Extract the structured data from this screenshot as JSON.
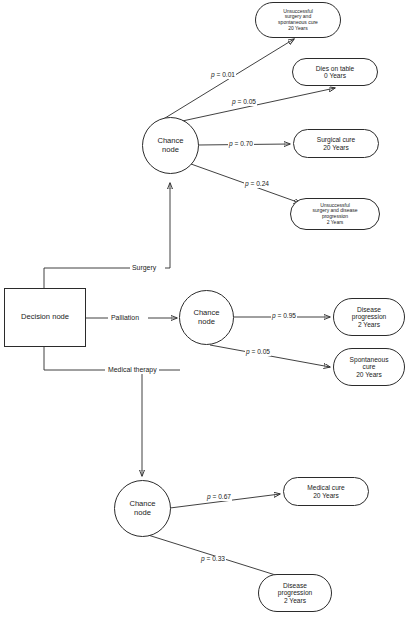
{
  "diagram": {
    "stroke_color": "#2b2b2b",
    "background_color": "#ffffff",
    "decision_node": {
      "label": "Decision node"
    },
    "branches": [
      {
        "id": "surgery",
        "label": "Surgery"
      },
      {
        "id": "palliation",
        "label": "Palliation"
      },
      {
        "id": "medical-therapy",
        "label": "Medical therapy"
      }
    ],
    "chance_nodes": [
      {
        "id": "surgery-chance",
        "line1": "Chance",
        "line2": "node"
      },
      {
        "id": "palliation-chance",
        "line1": "Chance",
        "line2": "node"
      },
      {
        "id": "medical-chance",
        "line1": "Chance",
        "line2": "node"
      }
    ],
    "probabilities": [
      {
        "id": "p-unsuccessful-spontaneous",
        "p": "p",
        "eq": " = 0.01"
      },
      {
        "id": "p-dies-on-table",
        "p": "p",
        "eq": " = 0.05"
      },
      {
        "id": "p-surgical-cure",
        "p": "p",
        "eq": " = 0.70"
      },
      {
        "id": "p-unsuccessful-progression",
        "p": "p",
        "eq": " = 0.24"
      },
      {
        "id": "p-palliation-progression",
        "p": "p",
        "eq": " = 0.95"
      },
      {
        "id": "p-palliation-spontaneous",
        "p": "p",
        "eq": " = 0.05"
      },
      {
        "id": "p-medical-cure",
        "p": "p",
        "eq": " = 0.67"
      },
      {
        "id": "p-medical-progression",
        "p": "p",
        "eq": " = 0.33"
      }
    ],
    "outcomes": [
      {
        "id": "unsuccessful-surgery-spontaneous-cure",
        "lines": [
          "Unsuccessful",
          "surgery and",
          "spontaneous cure",
          "20 Years"
        ]
      },
      {
        "id": "dies-on-table",
        "lines": [
          "Dies on table",
          "0 Years"
        ]
      },
      {
        "id": "surgical-cure",
        "lines": [
          "Surgical cure",
          "20 Years"
        ]
      },
      {
        "id": "unsuccessful-surgery-disease-progression",
        "lines": [
          "Unsuccessful",
          "surgery and disease",
          "progression",
          "2 Years"
        ]
      },
      {
        "id": "palliation-disease-progression",
        "lines": [
          "Disease",
          "progression",
          "2 Years"
        ]
      },
      {
        "id": "palliation-spontaneous-cure",
        "lines": [
          "Spontaneous",
          "cure",
          "20 Years"
        ]
      },
      {
        "id": "medical-cure",
        "lines": [
          "Medical cure",
          "20 Years"
        ]
      },
      {
        "id": "medical-disease-progression",
        "lines": [
          "Disease",
          "progression",
          "2 Years"
        ]
      }
    ],
    "caption": {
      "text": ""
    }
  }
}
